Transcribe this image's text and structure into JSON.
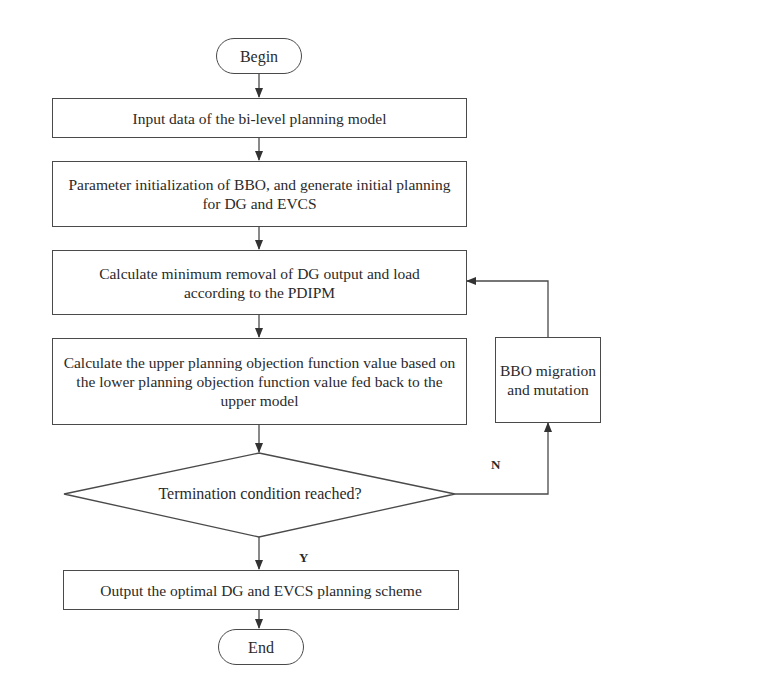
{
  "flowchart": {
    "nodes": {
      "begin": {
        "label": "Begin",
        "shape": "terminator"
      },
      "input_data": {
        "label": "Input data of the bi-level planning model",
        "shape": "process"
      },
      "init": {
        "label": "Parameter initialization of BBO, and  generate initial planning for DG and EVCS",
        "shape": "process"
      },
      "calc_min_removal": {
        "label": "Calculate minimum removal of DG output and load according to the PDIPM",
        "shape": "process"
      },
      "calc_upper": {
        "label": "Calculate the upper planning objection function value based on the lower planning objection function value fed back to the upper model",
        "shape": "process"
      },
      "bbo_migration": {
        "label": "BBO migration and mutation",
        "shape": "process"
      },
      "termination": {
        "label": "Termination condition reached?",
        "shape": "decision"
      },
      "output": {
        "label": "Output the optimal DG and EVCS planning scheme",
        "shape": "process"
      },
      "end": {
        "label": "End",
        "shape": "terminator"
      }
    },
    "edge_labels": {
      "no": "N",
      "yes": "Y"
    },
    "edges": [
      {
        "from": "begin",
        "to": "input_data"
      },
      {
        "from": "input_data",
        "to": "init"
      },
      {
        "from": "init",
        "to": "calc_min_removal"
      },
      {
        "from": "calc_min_removal",
        "to": "calc_upper"
      },
      {
        "from": "calc_upper",
        "to": "termination"
      },
      {
        "from": "termination",
        "to": "output",
        "label": "Y"
      },
      {
        "from": "termination",
        "to": "bbo_migration",
        "label": "N"
      },
      {
        "from": "bbo_migration",
        "to": "calc_min_removal"
      },
      {
        "from": "output",
        "to": "end"
      }
    ],
    "colors": {
      "stroke": "#4a4a4a",
      "text": "#2a2a2a",
      "background": "#ffffff"
    }
  }
}
